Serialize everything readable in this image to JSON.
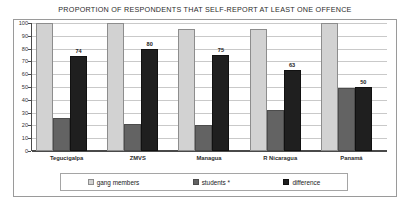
{
  "chart_data": {
    "type": "bar",
    "title": "PROPORTION OF RESPONDENTS THAT SELF-REPORT AT LEAST ONE OFFENCE",
    "xlabel": "",
    "ylabel": "%",
    "ylim": [
      0,
      100
    ],
    "ytick_step": 10,
    "yticks": [
      100,
      90,
      80,
      70,
      60,
      50,
      40,
      30,
      20,
      10,
      0
    ],
    "grid": true,
    "legend_position": "bottom",
    "categories": [
      "Tegucigalpa",
      "ZMVS",
      "Managua",
      "R Nicaragua",
      "Panamá"
    ],
    "series": [
      {
        "name": "gang members",
        "color": "#d2d2d2",
        "values": [
          100,
          100,
          95,
          95,
          100
        ],
        "labels": [
          "",
          "",
          "",
          "",
          ""
        ]
      },
      {
        "name": "students *",
        "color": "#636363",
        "values": [
          26,
          21,
          20,
          32,
          49
        ],
        "labels": [
          "",
          "",
          "",
          "",
          ""
        ]
      },
      {
        "name": "difference",
        "color": "#1f1f1f",
        "values": [
          74,
          80,
          75,
          63,
          50
        ],
        "labels": [
          "74",
          "80",
          "75",
          "63",
          "50"
        ]
      }
    ]
  },
  "legend": {
    "items": [
      {
        "label": "gang members"
      },
      {
        "label": "students *"
      },
      {
        "label": "difference"
      }
    ]
  }
}
